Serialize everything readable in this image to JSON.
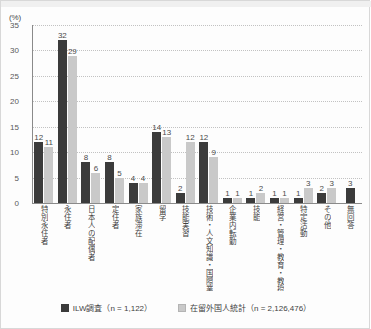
{
  "chart_data": {
    "type": "bar",
    "title": "",
    "xlabel": "",
    "ylabel": "(%)",
    "ylim": [
      0,
      35
    ],
    "yticks": [
      0,
      5,
      10,
      15,
      20,
      25,
      30,
      35
    ],
    "grid": true,
    "legend_position": "bottom",
    "categories": [
      "特別永住者",
      "永住者",
      "日本人の配偶者",
      "定住者",
      "家族滞在",
      "留学",
      "技能実習",
      "技術・人文知識・国際業務",
      "企業内転勤",
      "技能",
      "経営・管理・教育・教授",
      "特定活動",
      "その他",
      "無回答"
    ],
    "series": [
      {
        "name": "ILW調査 (n = 1,122)",
        "color": "#3b3b3b",
        "values": [
          12,
          32,
          8,
          8,
          4,
          14,
          2,
          12,
          1,
          1,
          1,
          1,
          2,
          3
        ]
      },
      {
        "name": "在留外国人統計 (n = 2,126,476)",
        "color": "#c9c9c9",
        "values": [
          11,
          29,
          6,
          5,
          4,
          13,
          12,
          9,
          1,
          2,
          1,
          3,
          3,
          null
        ]
      }
    ]
  },
  "legend": {
    "items": [
      {
        "label": "ILW調査（n = 1,122）",
        "swatch": "dark-square-icon"
      },
      {
        "label": "在留外国人統計（n = 2,126,476）",
        "swatch": "light-square-icon"
      }
    ]
  },
  "axis": {
    "unit": "(%)"
  }
}
